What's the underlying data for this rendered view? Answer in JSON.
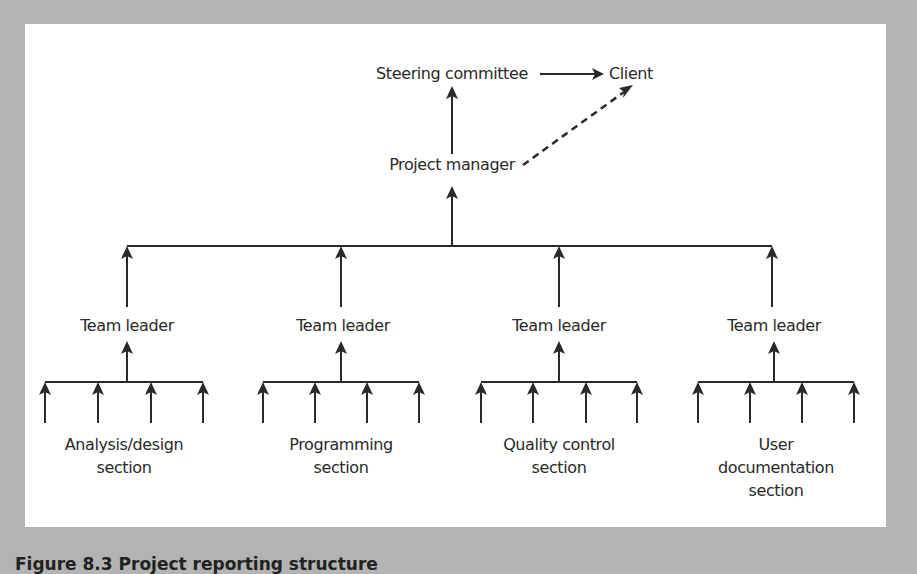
{
  "top": {
    "steering_committee": "Steering committee",
    "client": "Client",
    "project_manager": "Project manager"
  },
  "teams": [
    {
      "leader": "Team leader",
      "section_lines": [
        "Analysis/design",
        "section"
      ]
    },
    {
      "leader": "Team leader",
      "section_lines": [
        "Programming",
        "section"
      ]
    },
    {
      "leader": "Team leader",
      "section_lines": [
        "Quality control",
        "section"
      ]
    },
    {
      "leader": "Team leader",
      "section_lines": [
        "User",
        "documentation",
        "section"
      ]
    }
  ],
  "caption": "Figure 8.3   Project reporting structure",
  "colors": {
    "background": "#b3b3b3",
    "panel": "#ffffff",
    "ink": "#2a2a2a"
  }
}
